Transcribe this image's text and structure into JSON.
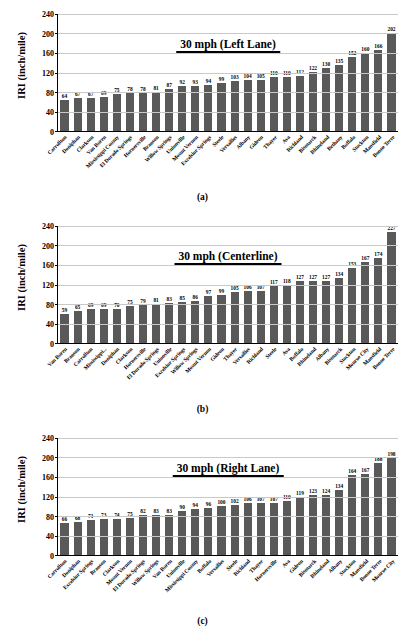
{
  "figure": {
    "axis_title_y": "IRI (inch/mile)",
    "y_ticks": [
      0,
      40,
      80,
      120,
      160,
      200,
      240
    ],
    "accent_bar_color": "#595959",
    "grid_color": "#c9c9c9",
    "panel_captions": [
      "(a)",
      "(b)",
      "(c)"
    ]
  },
  "chart_data": [
    {
      "type": "bar",
      "title": "30 mph (Left Lane)",
      "caption": "(a)",
      "xlabel": "",
      "ylabel": "IRI (inch/mile)",
      "ylim": [
        0,
        240
      ],
      "ytick_step": 40,
      "grid": true,
      "legend": "none",
      "bar_color": "#595959",
      "categories": [
        "Carrollton",
        "Doniphan",
        "Clarkson",
        "Van Buren",
        "Mississippi County",
        "El Dorado Springs",
        "Hornersville",
        "Branson",
        "Willow Springs",
        "Unionville",
        "Mount Vernon",
        "Excelsior Springs",
        "Steele",
        "Versailles",
        "Albany",
        "Gideon",
        "Thayer",
        "Ava",
        "Richland",
        "Bismarck",
        "Rhineland",
        "Bethany",
        "Buffalo",
        "Stockton",
        "Mansfield",
        "Bonne Terre"
      ],
      "values": [
        64,
        67,
        67,
        69,
        75,
        78,
        78,
        81,
        87,
        92,
        93,
        94,
        99,
        103,
        104,
        105,
        110,
        110,
        112,
        122,
        130,
        135,
        152,
        160,
        166,
        202
      ]
    },
    {
      "type": "bar",
      "title": "30 mph (Centerline)",
      "caption": "(b)",
      "xlabel": "",
      "ylabel": "IRI (inch/mile)",
      "ylim": [
        0,
        240
      ],
      "ytick_step": 40,
      "grid": true,
      "legend": "none",
      "bar_color": "#595959",
      "categories": [
        "Van Buren",
        "Branson",
        "Carrollton",
        "Mississippi...",
        "Doniphan",
        "Clarkson",
        "Hornersville",
        "El Dorado Springs",
        "Unionville",
        "Excelsior Springs",
        "Willow Springs",
        "Mount Vernon",
        "Gideon",
        "Thayer",
        "Versailles",
        "Richland",
        "Steele",
        "Ava",
        "Buffalo",
        "Rhineland",
        "Albany",
        "Bismarck",
        "Stockton",
        "Monroe City",
        "Mansfield",
        "Bonne Terre"
      ],
      "values": [
        59,
        65,
        69,
        69,
        70,
        75,
        79,
        81,
        83,
        85,
        86,
        97,
        99,
        105,
        106,
        107,
        117,
        118,
        127,
        127,
        127,
        134,
        153,
        167,
        174,
        227
      ]
    },
    {
      "type": "bar",
      "title": "30 mph (Right Lane)",
      "caption": "(c)",
      "xlabel": "",
      "ylabel": "IRI (inch/mile)",
      "ylim": [
        0,
        240
      ],
      "ytick_step": 40,
      "grid": true,
      "legend": "none",
      "bar_color": "#595959",
      "categories": [
        "Carrollton",
        "Doniphan",
        "Excelsior Springs",
        "Branson",
        "Clarkson",
        "Mount Vernon",
        "El Dorado Springs",
        "Willow Springs",
        "Van Buren",
        "Unionville",
        "Mississippi County",
        "Buffalo",
        "Versailles",
        "Steele",
        "Richland",
        "Thayer",
        "Hornersville",
        "Ava",
        "Gideon",
        "Bismarck",
        "Rhineland",
        "Albany",
        "Stockton",
        "Mansfield",
        "Bonne Terre",
        "Monroe City"
      ],
      "values": [
        66,
        68,
        71,
        73,
        74,
        75,
        82,
        83,
        83,
        90,
        94,
        96,
        100,
        102,
        106,
        107,
        107,
        110,
        119,
        123,
        124,
        134,
        164,
        167,
        188,
        198
      ]
    }
  ]
}
